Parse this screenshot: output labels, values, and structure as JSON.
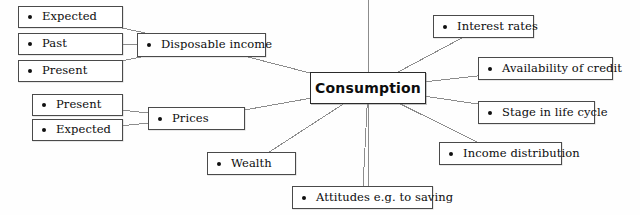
{
  "diagram": {
    "type": "concept-map",
    "center": {
      "id": "consumption",
      "label": "Consumption",
      "x": 310,
      "y": 72,
      "w": 116,
      "h": 32
    },
    "nodes": [
      {
        "id": "expected-income",
        "label": "Expected",
        "x": 18,
        "y": 6,
        "w": 105,
        "h": 22
      },
      {
        "id": "past-income",
        "label": "Past",
        "x": 18,
        "y": 33,
        "w": 105,
        "h": 22
      },
      {
        "id": "present-income",
        "label": "Present",
        "x": 18,
        "y": 60,
        "w": 105,
        "h": 22
      },
      {
        "id": "disposable-income",
        "label": "Disposable income",
        "x": 137,
        "y": 33,
        "w": 129,
        "h": 24
      },
      {
        "id": "present-prices",
        "label": "Present",
        "x": 32,
        "y": 94,
        "w": 91,
        "h": 22
      },
      {
        "id": "expected-prices",
        "label": "Expected",
        "x": 32,
        "y": 119,
        "w": 91,
        "h": 22
      },
      {
        "id": "prices",
        "label": "Prices",
        "x": 148,
        "y": 107,
        "w": 97,
        "h": 23
      },
      {
        "id": "wealth",
        "label": "Wealth",
        "x": 207,
        "y": 152,
        "w": 89,
        "h": 23
      },
      {
        "id": "attitudes",
        "label": "Attitudes e.g. to saving",
        "x": 292,
        "y": 186,
        "w": 141,
        "h": 23
      },
      {
        "id": "interest-rates",
        "label": "Interest rates",
        "x": 433,
        "y": 15,
        "w": 101,
        "h": 23
      },
      {
        "id": "availability-credit",
        "label": "Availability of credit",
        "x": 478,
        "y": 57,
        "w": 135,
        "h": 23
      },
      {
        "id": "stage-life-cycle",
        "label": "Stage in life cycle",
        "x": 478,
        "y": 101,
        "w": 117,
        "h": 23
      },
      {
        "id": "income-distribution",
        "label": "Income distribution",
        "x": 439,
        "y": 142,
        "w": 123,
        "h": 23
      }
    ],
    "edges": [
      {
        "from": "expected-income",
        "to": "disposable-income"
      },
      {
        "from": "past-income",
        "to": "disposable-income"
      },
      {
        "from": "present-income",
        "to": "disposable-income"
      },
      {
        "from": "disposable-income",
        "to": "consumption"
      },
      {
        "from": "present-prices",
        "to": "prices"
      },
      {
        "from": "expected-prices",
        "to": "prices"
      },
      {
        "from": "prices",
        "to": "consumption"
      },
      {
        "from": "wealth",
        "to": "consumption"
      },
      {
        "from": "attitudes",
        "to": "consumption"
      },
      {
        "from": "interest-rates",
        "to": "consumption"
      },
      {
        "from": "availability-credit",
        "to": "consumption"
      },
      {
        "from": "stage-life-cycle",
        "to": "consumption"
      },
      {
        "from": "income-distribution",
        "to": "consumption"
      }
    ],
    "colors": {
      "background": "#fefefe",
      "box_border": "#4a4a4a",
      "text": "#0d0d0d",
      "connector": "#8c8c8c",
      "bullet": "#101010"
    }
  }
}
